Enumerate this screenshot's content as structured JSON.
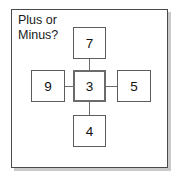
{
  "card": {
    "prompt_text": "Plus or\nMinus?"
  },
  "diagram": {
    "type": "cross-operator-puzzle",
    "nodes": [
      {
        "id": "top",
        "label": "7"
      },
      {
        "id": "left",
        "label": "9"
      },
      {
        "id": "center",
        "label": "3"
      },
      {
        "id": "right",
        "label": "5"
      },
      {
        "id": "bottom",
        "label": "4"
      }
    ],
    "connections": [
      {
        "from": "center",
        "to": "top"
      },
      {
        "from": "center",
        "to": "left"
      },
      {
        "from": "center",
        "to": "right"
      },
      {
        "from": "center",
        "to": "bottom"
      }
    ]
  },
  "colors": {
    "frame_border": "#4a4a4a",
    "frame_shadow": "#c9c9c9",
    "node_border": "#5c5c5c",
    "center_node_border": "#6b6b6b",
    "link": "#6b6b6b",
    "text": "#111111",
    "background": "#ffffff"
  }
}
